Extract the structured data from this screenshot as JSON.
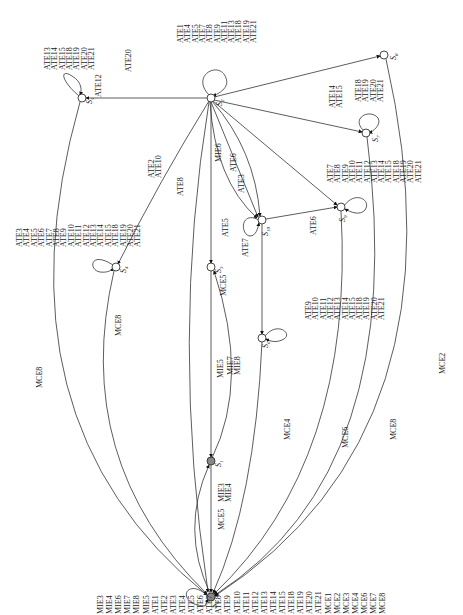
{
  "diagram": {
    "type": "state-transition-graph",
    "orientation": "rotated-90-ccw",
    "states": [
      {
        "id": "S0",
        "label": "S0",
        "initial": true,
        "x": 211,
        "y": 597,
        "self_loop": [
          "MIE3",
          "MIE4",
          "MIE6",
          "MIE7",
          "MIE8",
          "MIE5",
          "ATE1",
          "ATE2",
          "ATE3",
          "ATE4",
          "ATE5",
          "ATE6",
          "ATE7",
          "ATE8",
          "ATE9",
          "ATE10",
          "ATE11",
          "ATE12",
          "ATE13",
          "ATE14",
          "ATE15",
          "ATE18",
          "ATE19",
          "ATE20",
          "ATE21",
          "MCE1",
          "MCE2",
          "MCE3",
          "MCE4",
          "MCE6",
          "MCE7",
          "MCE8"
        ]
      },
      {
        "id": "S1",
        "label": "S1",
        "x": 211,
        "y": 461
      },
      {
        "id": "S2",
        "label": "S2",
        "x": 211,
        "y": 98,
        "self_loop": [
          "ATE1",
          "ATE4",
          "ATE5",
          "ATE7",
          "ATE8",
          "ATE9",
          "ATE11",
          "ATE13",
          "ATE18",
          "ATE19",
          "ATE21"
        ]
      },
      {
        "id": "S3",
        "label": "S3",
        "x": 211,
        "y": 267
      },
      {
        "id": "S4",
        "label": "S4",
        "x": 116,
        "y": 267,
        "self_loop": [
          "ATE3",
          "ATE4",
          "ATE5",
          "ATE6",
          "ATE7",
          "ATE8",
          "ATE9",
          "ATE10",
          "ATE11",
          "ATE12",
          "ATE13",
          "ATE14",
          "ATE15",
          "ATE18",
          "ATE19",
          "ATE20",
          "ATE21"
        ]
      },
      {
        "id": "S5",
        "label": "S5",
        "x": 82,
        "y": 98,
        "self_loop": [
          "ATE13",
          "ATE14",
          "ATE15",
          "ATE18",
          "ATE19",
          "ATE20",
          "ATE21"
        ]
      },
      {
        "id": "S6",
        "label": "S6",
        "x": 262,
        "y": 338,
        "self_loop": [
          "ATE9",
          "ATE10",
          "ATE11",
          "ATE12",
          "ATE13",
          "ATE14",
          "ATE15",
          "ATE18",
          "ATE19",
          "ATE20",
          "ATE21"
        ]
      },
      {
        "id": "S7",
        "label": "S7",
        "x": 366,
        "y": 133,
        "self_loop": [
          "ATE18",
          "ATE19",
          "ATE20",
          "ATE21"
        ]
      },
      {
        "id": "S8",
        "label": "S8",
        "x": 384,
        "y": 55
      },
      {
        "id": "S9",
        "label": "S9",
        "x": 341,
        "y": 207,
        "self_loop": [
          "ATE7",
          "ATE8",
          "ATE9",
          "ATE10",
          "ATE11",
          "ATE12",
          "ATE13",
          "ATE14",
          "ATE15",
          "ATE18",
          "ATE19",
          "ATE20",
          "ATE21"
        ]
      },
      {
        "id": "S10",
        "label": "S10",
        "x": 262,
        "y": 220,
        "self_loop": [
          "ATE7"
        ]
      }
    ],
    "edges": [
      {
        "from": "S2",
        "to": "S5",
        "labels": [
          "ATE12"
        ]
      },
      {
        "from": "S2",
        "to": "S4",
        "labels": [
          "ATE2",
          "ATE10"
        ]
      },
      {
        "from": "S2",
        "to": "S8",
        "labels": [
          "ATE20"
        ]
      },
      {
        "from": "S2",
        "to": "S7",
        "labels": [
          "ATE14",
          "ATE15"
        ]
      },
      {
        "from": "S2",
        "to": "S9",
        "labels": [
          "ATE6"
        ]
      },
      {
        "from": "S2",
        "to": "S10",
        "labels": [
          "ATE3"
        ]
      },
      {
        "from": "S2",
        "to": "S10",
        "labels": [
          "ATE8"
        ]
      },
      {
        "from": "S2",
        "to": "S10",
        "labels": [
          "ATE5"
        ]
      },
      {
        "from": "S2",
        "to": "S3",
        "labels": [
          "MIE6"
        ]
      },
      {
        "from": "S2",
        "to": "S0",
        "labels": [
          "MCE5"
        ]
      },
      {
        "from": "S10",
        "to": "S9",
        "labels": [
          "ATE6"
        ]
      },
      {
        "from": "S10",
        "to": "S6",
        "labels": []
      },
      {
        "from": "S3",
        "to": "S1",
        "labels": [
          "MIE5"
        ]
      },
      {
        "from": "S1",
        "to": "S3",
        "labels": [
          "MIE7",
          "MIE8"
        ]
      },
      {
        "from": "S0",
        "to": "S1",
        "labels": [
          "MIE3",
          "MIE4"
        ]
      },
      {
        "from": "S1",
        "to": "S0",
        "labels": [
          "MCE5"
        ]
      },
      {
        "from": "S6",
        "to": "S0",
        "labels": [
          "MCE4"
        ]
      },
      {
        "from": "S9",
        "to": "S0",
        "labels": [
          "MCE6"
        ]
      },
      {
        "from": "S7",
        "to": "S0",
        "labels": [
          "MCE8"
        ]
      },
      {
        "from": "S8",
        "to": "S0",
        "labels": [
          "MCE2"
        ]
      },
      {
        "from": "S5",
        "to": "S0",
        "labels": [
          "MCE8"
        ]
      },
      {
        "from": "S4",
        "to": "S0",
        "labels": [
          "MCE8"
        ]
      }
    ]
  },
  "text": {
    "s0_loop": [
      "MIE3",
      "MIE4",
      "MIE6",
      "MIE7",
      "MIE8",
      "MIE5",
      "ATE1",
      "ATE2",
      "ATE3",
      "ATE4",
      "ATE5",
      "ATE6",
      "ATE7",
      "ATE8",
      "ATE9",
      "ATE10",
      "ATE11",
      "ATE12",
      "ATE13",
      "ATE14",
      "ATE15",
      "ATE18",
      "ATE19",
      "ATE20",
      "ATE21",
      "MCE1",
      "MCE2",
      "MCE3",
      "MCE4",
      "MCE6",
      "MCE7",
      "MCE8"
    ],
    "s2_loop": [
      "ATE1",
      "ATE4",
      "ATE5",
      "ATE7",
      "ATE8",
      "ATE9",
      "ATE11",
      "ATE13",
      "ATE18",
      "ATE19",
      "ATE21"
    ],
    "s5_loop": [
      "ATE13",
      "ATE14",
      "ATE15",
      "ATE18",
      "ATE19",
      "ATE20",
      "ATE21"
    ],
    "s4_loop": [
      "ATE3",
      "ATE4",
      "ATE5",
      "ATE6",
      "ATE7",
      "ATE8",
      "ATE9",
      "ATE10",
      "ATE11",
      "ATE12",
      "ATE13",
      "ATE14",
      "ATE15",
      "ATE18",
      "ATE19",
      "ATE20",
      "ATE21"
    ],
    "s7_loop": [
      "ATE18",
      "ATE19",
      "ATE20",
      "ATE21"
    ],
    "s9_loop": [
      "ATE7",
      "ATE8",
      "ATE9",
      "ATE10",
      "ATE11",
      "ATE12",
      "ATE13",
      "ATE14",
      "ATE15",
      "ATE18",
      "ATE19",
      "ATE20",
      "ATE21"
    ],
    "s6_loop": [
      "ATE9",
      "ATE10",
      "ATE11",
      "ATE12",
      "ATE13",
      "ATE14",
      "ATE15",
      "ATE18",
      "ATE19",
      "ATE20",
      "ATE21"
    ],
    "e_s2_s5": "ATE12",
    "e_s2_s4": [
      "ATE2",
      "ATE10"
    ],
    "e_s2_s8": "ATE20",
    "e_s2_s7": [
      "ATE14",
      "ATE15"
    ],
    "e_s2_s9": "ATE6",
    "e_s2_s10_a": "ATE3",
    "e_s2_s10_b": "ATE8",
    "e_s2_s10_c": "ATE5",
    "e_s10_loop": "ATE7",
    "e_s10_s9": "ATE6",
    "e_s2_s3": "MIE6",
    "e_s2_s0": "MCE5",
    "e_s3_s1": "MIE5",
    "e_s1_s3": [
      "MIE7",
      "MIE8"
    ],
    "e_s0_s1": [
      "MIE3",
      "MIE4"
    ],
    "e_s1_s0": "MCE5",
    "e_s6_s0": "MCE4",
    "e_s9_s0": "MCE6",
    "e_s7_s0": "MCE8",
    "e_s8_s0": "MCE2",
    "e_s5_s0": "MCE8",
    "e_s4_s0": "MCE8",
    "state_labels": {
      "S0": "S",
      "S1": "S",
      "S2": "S",
      "S3": "S",
      "S4": "S",
      "S5": "S",
      "S6": "S",
      "S7": "S",
      "S8": "S",
      "S9": "S",
      "S10": "S"
    },
    "state_subs": {
      "S0": "0",
      "S1": "1",
      "S2": "2",
      "S3": "3",
      "S4": "4",
      "S5": "5",
      "S6": "6",
      "S7": "7",
      "S8": "8",
      "S9": "9",
      "S10": "10"
    }
  }
}
